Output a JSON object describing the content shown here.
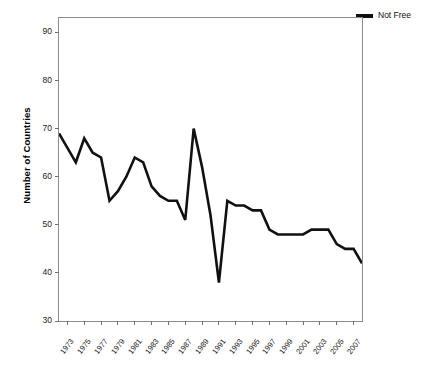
{
  "chart_data": {
    "type": "line",
    "title": "",
    "xlabel": "",
    "ylabel": "Number of Countries",
    "ylim": [
      30,
      93
    ],
    "yticks": [
      30,
      40,
      50,
      60,
      70,
      80,
      90
    ],
    "xlim": [
      1972,
      2008
    ],
    "xticks": [
      1973,
      1975,
      1977,
      1979,
      1981,
      1983,
      1985,
      1987,
      1989,
      1991,
      1993,
      1995,
      1997,
      1999,
      2001,
      2003,
      2005,
      2007
    ],
    "grid": false,
    "legend_position": "top-right",
    "series": [
      {
        "name": "Not Free",
        "color": "#111111",
        "x": [
          1972,
          1973,
          1974,
          1975,
          1976,
          1977,
          1978,
          1979,
          1980,
          1981,
          1982,
          1983,
          1984,
          1985,
          1986,
          1987,
          1988,
          1989,
          1990,
          1991,
          1992,
          1993,
          1994,
          1995,
          1996,
          1997,
          1998,
          1999,
          2000,
          2001,
          2002,
          2003,
          2004,
          2005,
          2006,
          2007,
          2008
        ],
        "values": [
          69,
          66,
          63,
          68,
          65,
          64,
          55,
          57,
          60,
          64,
          63,
          58,
          56,
          55,
          55,
          51,
          70,
          62,
          52,
          38,
          55,
          54,
          54,
          53,
          53,
          49,
          48,
          48,
          48,
          48,
          49,
          49,
          49,
          46,
          45,
          45,
          42
        ]
      }
    ]
  },
  "legend": {
    "entries": [
      {
        "label": "Not Free",
        "color": "#111111"
      }
    ]
  },
  "axes": {
    "ylabel": "Number of Countries"
  }
}
